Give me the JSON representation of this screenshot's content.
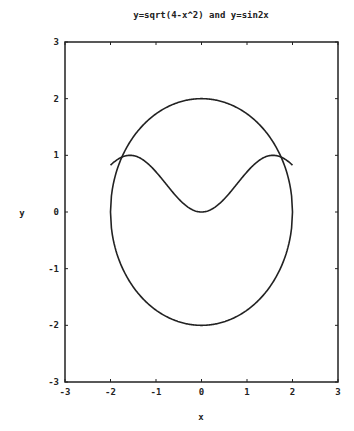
{
  "chart_data": {
    "type": "line",
    "title": "y=sqrt(4-x^2) and y=sin2x",
    "xlabel": "x",
    "ylabel": "y",
    "xlim": [
      -3,
      3
    ],
    "ylim": [
      -3,
      3
    ],
    "xticks": [
      "-3",
      "-2",
      "-1",
      "0",
      "1",
      "2",
      "3"
    ],
    "yticks": [
      "-3",
      "-2",
      "-1",
      "0",
      "1",
      "2",
      "3"
    ],
    "grid": false,
    "series": [
      {
        "name": "y=sqrt(4-x^2)",
        "expr": "circle upper",
        "x_range": [
          -2,
          2
        ]
      },
      {
        "name": "y=-sqrt(4-x^2)",
        "expr": "circle lower",
        "x_range": [
          -2,
          2
        ]
      },
      {
        "name": "y=sin(x)^2 shaped curve",
        "expr": "sin2x",
        "x_range": [
          -2,
          2
        ]
      }
    ],
    "color": "#222222"
  }
}
